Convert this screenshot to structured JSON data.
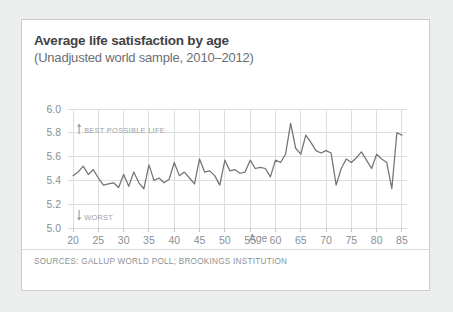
{
  "card": {
    "title": "Average life satisfaction by age",
    "subtitle": "(Unadjusted world sample, 2010–2012)",
    "sources": "SOURCES: GALLUP WORLD POLL; BROOKINGS INSTITUTION"
  },
  "annotations": {
    "top": {
      "label": "BEST POSSIBLE LIFE",
      "arrow": "up-arrow-icon",
      "value": 5.88
    },
    "bottom": {
      "label": "WORST",
      "arrow": "down-arrow-icon",
      "value": 5.06
    }
  },
  "colors": {
    "line": "#6f7478",
    "grid": "#dcdedf",
    "text": "#8a8f93",
    "title": "#3f4346",
    "subtitle": "#6a6f73",
    "card_border": "#c9cbcc",
    "page_background": "#eceded",
    "card_background": "#ffffff"
  },
  "chart_data": {
    "type": "line",
    "title": "Average life satisfaction by age",
    "subtitle": "(Unadjusted world sample, 2010–2012)",
    "xlabel": "Age",
    "ylabel": "",
    "xlim": [
      19,
      86
    ],
    "ylim": [
      5.0,
      6.0
    ],
    "xticks": [
      20,
      25,
      30,
      35,
      40,
      45,
      50,
      55,
      60,
      65,
      70,
      75,
      80,
      85
    ],
    "yticks": [
      5.0,
      5.2,
      5.4,
      5.6,
      5.8,
      6.0
    ],
    "ytick_labels": [
      "5.0",
      "5.2",
      "5.4",
      "5.6",
      "5.8",
      "6.0"
    ],
    "grid": true,
    "legend": false,
    "x": [
      20,
      21,
      22,
      23,
      24,
      25,
      26,
      27,
      28,
      29,
      30,
      31,
      32,
      33,
      34,
      35,
      36,
      37,
      38,
      39,
      40,
      41,
      42,
      43,
      44,
      45,
      46,
      47,
      48,
      49,
      50,
      51,
      52,
      53,
      54,
      55,
      56,
      57,
      58,
      59,
      60,
      61,
      62,
      63,
      64,
      65,
      66,
      67,
      68,
      69,
      70,
      71,
      72,
      73,
      74,
      75,
      76,
      77,
      78,
      79,
      80,
      81,
      82,
      83,
      84,
      85
    ],
    "values": [
      5.44,
      5.47,
      5.52,
      5.45,
      5.49,
      5.42,
      5.36,
      5.37,
      5.38,
      5.34,
      5.45,
      5.35,
      5.47,
      5.38,
      5.33,
      5.53,
      5.4,
      5.42,
      5.38,
      5.41,
      5.55,
      5.44,
      5.47,
      5.42,
      5.37,
      5.58,
      5.47,
      5.48,
      5.44,
      5.36,
      5.57,
      5.48,
      5.49,
      5.46,
      5.47,
      5.57,
      5.5,
      5.51,
      5.5,
      5.43,
      5.57,
      5.55,
      5.62,
      5.88,
      5.67,
      5.62,
      5.78,
      5.72,
      5.65,
      5.63,
      5.65,
      5.63,
      5.36,
      5.5,
      5.58,
      5.55,
      5.59,
      5.64,
      5.57,
      5.5,
      5.62,
      5.58,
      5.55,
      5.33,
      5.8,
      5.78
    ],
    "series_name": "Average life satisfaction"
  }
}
